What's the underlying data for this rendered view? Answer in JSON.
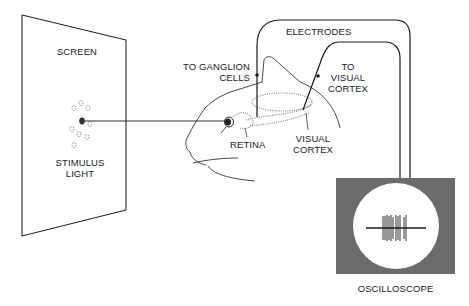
{
  "diagram": {
    "colors": {
      "line": "#1a1a1a",
      "oscilloscope_body": "#6b6b6b",
      "screen_bg": "#ffffff",
      "dotted_pathway": "#8a8a8a"
    },
    "labels": {
      "screen": "SCREEN",
      "stimulus_line1": "STIMULUS",
      "stimulus_line2": "LIGHT",
      "electrodes": "ELECTRODES",
      "ganglion_line1": "TO GANGLION",
      "ganglion_line2": "CELLS",
      "to_visual_line1": "TO",
      "to_visual_line2": "VISUAL",
      "to_visual_line3": "CORTEX",
      "retina": "RETINA",
      "visual_cortex_line1": "VISUAL",
      "visual_cortex_line2": "CORTEX",
      "oscilloscope": "OSCILLOSCOPE"
    },
    "components": [
      {
        "name": "screen",
        "icon": "screen-panel-icon"
      },
      {
        "name": "stimulus-light",
        "icon": "light-spot-icon"
      },
      {
        "name": "cat-head",
        "icon": "cat-head-icon"
      },
      {
        "name": "electrodes",
        "icon": "electrode-wire-icon"
      },
      {
        "name": "oscilloscope",
        "icon": "oscilloscope-icon"
      }
    ]
  }
}
